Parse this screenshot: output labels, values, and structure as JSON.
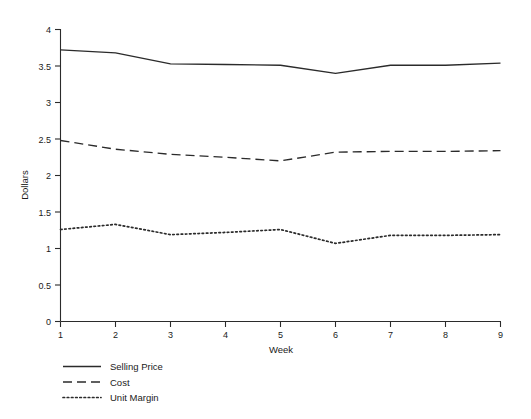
{
  "chart_data": {
    "type": "line",
    "title": "",
    "xlabel": "Week",
    "ylabel": "Dollars",
    "x": [
      1,
      2,
      3,
      4,
      5,
      6,
      7,
      8,
      9
    ],
    "categories": [
      "1",
      "2",
      "3",
      "4",
      "5",
      "6",
      "7",
      "8",
      "9"
    ],
    "xlim": [
      1,
      9
    ],
    "ylim": [
      0,
      4
    ],
    "xticks": [
      "1",
      "2",
      "3",
      "4",
      "5",
      "6",
      "7",
      "8",
      "9"
    ],
    "yticks": [
      "0",
      "0.5",
      "1",
      "1.5",
      "2",
      "2.5",
      "3",
      "3.5",
      "4"
    ],
    "ytick_values": [
      0,
      0.5,
      1,
      1.5,
      2,
      2.5,
      3,
      3.5,
      4
    ],
    "grid": false,
    "legend_position": "below-left",
    "series": [
      {
        "name": "Selling Price",
        "style": "solid",
        "color": "#2b2b2b",
        "values": [
          3.72,
          3.68,
          3.53,
          3.52,
          3.51,
          3.4,
          3.51,
          3.51,
          3.54
        ]
      },
      {
        "name": "Cost",
        "style": "dashed",
        "color": "#2b2b2b",
        "values": [
          2.48,
          2.36,
          2.29,
          2.25,
          2.2,
          2.32,
          2.33,
          2.33,
          2.34
        ]
      },
      {
        "name": "Unit Margin",
        "style": "dotted",
        "color": "#2b2b2b",
        "values": [
          1.26,
          1.33,
          1.19,
          1.22,
          1.26,
          1.07,
          1.18,
          1.18,
          1.19
        ]
      }
    ]
  },
  "axes": {
    "y_title": "Dollars",
    "x_title": "Week",
    "ytick_0": "0",
    "ytick_1": "0.5",
    "ytick_2": "1",
    "ytick_3": "1.5",
    "ytick_4": "2",
    "ytick_5": "2.5",
    "ytick_6": "3",
    "ytick_7": "3.5",
    "ytick_8": "4",
    "xtick_1": "1",
    "xtick_2": "2",
    "xtick_3": "3",
    "xtick_4": "4",
    "xtick_5": "5",
    "xtick_6": "6",
    "xtick_7": "7",
    "xtick_8": "8",
    "xtick_9": "9"
  },
  "legend": {
    "entries": [
      {
        "label": "Selling Price",
        "style": "solid"
      },
      {
        "label": "Cost",
        "style": "dashed"
      },
      {
        "label": "Unit Margin",
        "style": "dotted"
      }
    ]
  }
}
